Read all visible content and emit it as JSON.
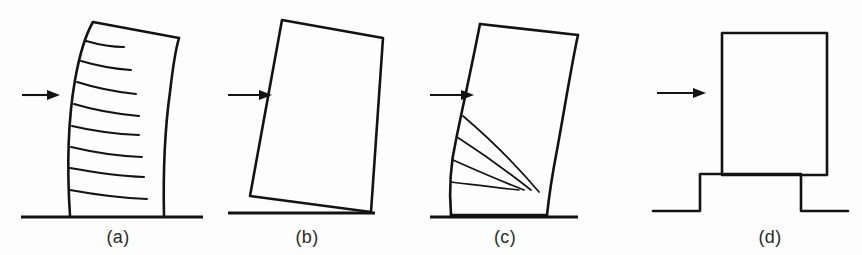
{
  "figure": {
    "background_color": "#fdfdfd",
    "ink_color": "#131313",
    "width": 862,
    "height": 255
  },
  "panels": [
    {
      "key": "a",
      "caption": "(a)",
      "caption_x": 118,
      "caption_y": 243,
      "mode_name": "flexural-cracking",
      "load_arrow_label": "lateral-load-arrow",
      "has_ground_line": true,
      "crack_count": 8,
      "crack_style": "horizontal-flexural"
    },
    {
      "key": "b",
      "caption": "(b)",
      "caption_x": 307,
      "caption_y": 243,
      "mode_name": "rocking-overturning",
      "load_arrow_label": "lateral-load-arrow",
      "has_ground_line": true,
      "crack_count": 0,
      "crack_style": "none"
    },
    {
      "key": "c",
      "caption": "(c)",
      "caption_x": 505,
      "caption_y": 243,
      "mode_name": "diagonal-shear-cracking",
      "load_arrow_label": "lateral-load-arrow",
      "has_ground_line": true,
      "crack_count": 4,
      "crack_style": "radiating-fan"
    },
    {
      "key": "d",
      "caption": "(d)",
      "caption_x": 770,
      "caption_y": 243,
      "mode_name": "sliding-on-base",
      "load_arrow_label": "lateral-load-arrow",
      "has_ground_line": true,
      "crack_count": 0,
      "crack_style": "none"
    }
  ],
  "geometry": {
    "panel_a": {
      "left_edge_path": "M 70 216 C 67 170 68 120 75 80 C 80 52 86 34 93 22",
      "right_edge_path": "M 164 216 C 163 170 165 128 170 92 C 173 66 176 48 179 38",
      "top_edge_path": "M 93 22 L 179 38",
      "cracks": [
        "M 86 41 C 100 45 112 47 124 47",
        "M 81 61 C 98 66 114 69 131 70",
        "M 77 82 C 96 88 116 92 136 94",
        "M 74 104 C 94 110 116 114 139 116",
        "M 72 126 C 93 131 114 134 139 135",
        "M 71 147 C 92 152 115 156 142 157",
        "M 70 168 C 92 172 116 176 144 177",
        "M 70 190 C 92 194 118 198 147 199"
      ],
      "ground": "M 21 217 L 203 217",
      "arrow": {
        "x1": 22,
        "y1": 95,
        "x2": 60,
        "y2": 95
      }
    },
    "panel_b": {
      "body_path": "M 282 20 L 383 38 L 371 212 L 250 196 Z",
      "ground": "M 228 213 L 375 213",
      "arrow": {
        "x1": 228,
        "y1": 95,
        "x2": 272,
        "y2": 95
      }
    },
    "panel_c": {
      "left_edge_path": "M 451 215 C 449 190 450 166 456 140 C 462 110 470 75 480 24",
      "right_edge_path": "M 547 215 C 549 196 552 176 557 150 C 564 112 572 62 578 35",
      "top_edge_path": "M 480 24 L 578 35",
      "bottom_edge_path": "M 451 215 L 547 215",
      "cracks": [
        "M 463 116 C 490 139 518 167 539 192",
        "M 457 137 C 485 155 512 175 531 190",
        "M 453 160 C 480 172 506 183 524 190",
        "M 451 182 C 476 185 500 188 519 190"
      ],
      "ground": "M 430 217 L 578 217",
      "arrow": {
        "x1": 430,
        "y1": 95,
        "x2": 474,
        "y2": 95
      }
    },
    "panel_d": {
      "body_path": "M 722 33 L 827 33 L 827 175 L 722 175 Z",
      "base_path": "M 653 211 L 700 211 L 700 174 L 801 174 L 801 211 L 848 211",
      "arrow": {
        "x1": 657,
        "y1": 93,
        "x2": 706,
        "y2": 93
      }
    }
  },
  "arrow_head": {
    "length": 13,
    "half_height": 5
  }
}
